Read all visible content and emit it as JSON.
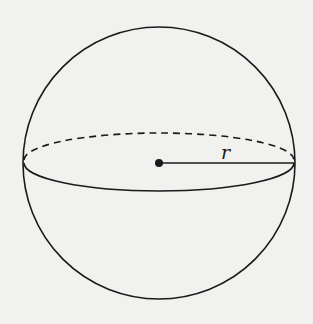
{
  "figure": {
    "type": "sphere",
    "radius_label": "r",
    "colors": {
      "background": "#f1f1ef",
      "stroke": "#1a1a1a"
    }
  }
}
